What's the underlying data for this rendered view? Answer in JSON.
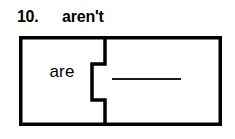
{
  "worksheet": {
    "item_number": "10.",
    "prompt_word": "aren't",
    "puzzle": {
      "left_piece_text": "are",
      "right_piece_answer": "",
      "answer_blank_label": "answer-blank"
    },
    "colors": {
      "ink": "#000000",
      "background": "#ffffff",
      "rule": "#1a1a1a"
    }
  }
}
